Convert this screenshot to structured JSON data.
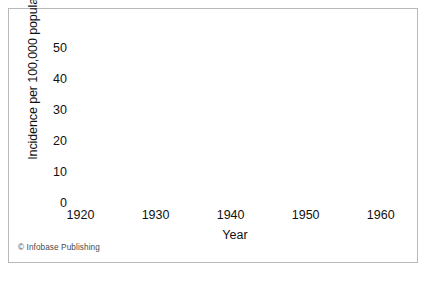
{
  "figure": {
    "credit": "© Infobase Publishing",
    "border_color": "#b9b9b9",
    "background": "#ffffff"
  },
  "chart_data": {
    "type": "line",
    "title": "",
    "subtitle": "",
    "xlabel": "Year",
    "ylabel": "Incidence per 100,000 population",
    "xlim": [
      1919,
      1961.5
    ],
    "ylim": [
      0,
      50
    ],
    "xticks": [
      1920,
      1930,
      1940,
      1950,
      1960
    ],
    "yticks": [
      0,
      10,
      20,
      30,
      40,
      50
    ],
    "xtick_labels": [
      "1920",
      "1930",
      "1940",
      "1950",
      "1960"
    ],
    "ytick_labels": [
      "0",
      "10",
      "20",
      "30",
      "40",
      "50"
    ],
    "grid": true,
    "grid_color": "#cfcfcf",
    "axis_color": "#1a1a1a",
    "line_color": "#1a1a1a",
    "line_width": 2.1,
    "legend": false,
    "legend_position": "none",
    "annotations": [],
    "series": [
      {
        "name": "Incidence",
        "x": [
          1920,
          1921,
          1922,
          1923,
          1924,
          1925,
          1926,
          1927,
          1928,
          1929,
          1930,
          1931,
          1932,
          1933,
          1934,
          1935,
          1936,
          1937,
          1938,
          1939,
          1940,
          1941,
          1942,
          1943,
          1944,
          1945,
          1946,
          1947,
          1948,
          1949,
          1950,
          1951,
          1952,
          1953,
          1954,
          1955,
          1956,
          1957,
          1958,
          1959,
          1960,
          1961
        ],
        "values": [
          33.0,
          43.5,
          34.0,
          31.0,
          30.5,
          40.0,
          35.0,
          29.5,
          24.0,
          19.0,
          21.5,
          20.8,
          20.5,
          19.0,
          17.5,
          15.5,
          13.0,
          11.8,
          11.5,
          10.0,
          9.5,
          8.0,
          6.8,
          5.0,
          3.5,
          2.8,
          2.5,
          2.3,
          2.0,
          1.6,
          1.4,
          1.3,
          1.2,
          1.2,
          1.3,
          1.2,
          1.0,
          0.9,
          0.7,
          0.5,
          0.4,
          0.2
        ]
      }
    ]
  }
}
